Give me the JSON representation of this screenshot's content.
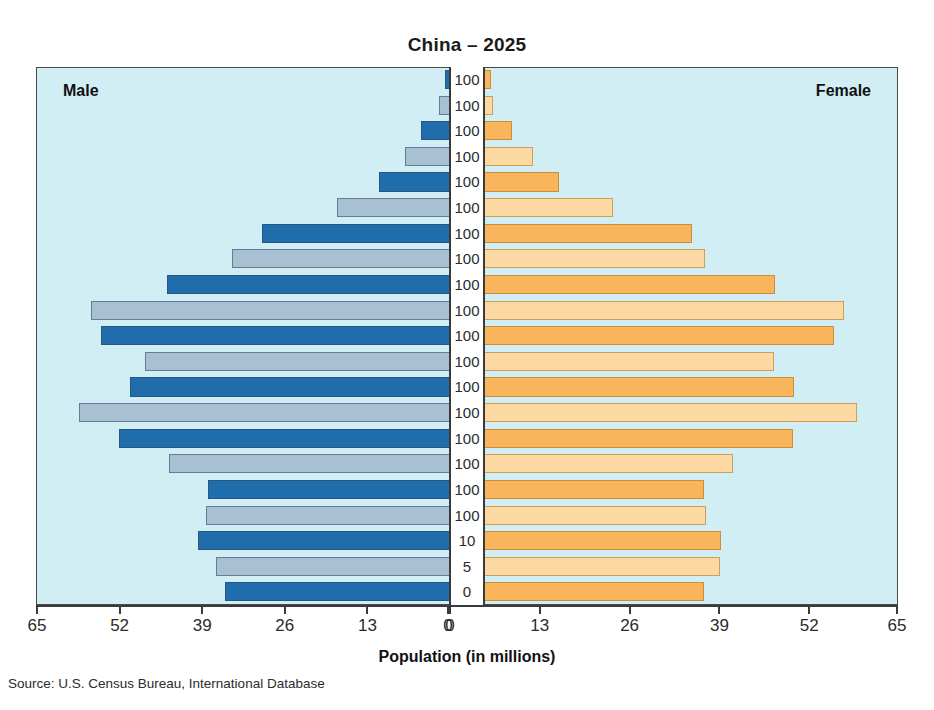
{
  "title": "China – 2025",
  "axis_title": "Population (in millions)",
  "source": "Source: U.S. Census Bureau, International Database",
  "labels": {
    "male": "Male",
    "female": "Female"
  },
  "colors": {
    "panel_background": "#d2eef5",
    "male_dark": "#1f6eab",
    "male_light": "#a9c0d2",
    "female_dark": "#f9b55b",
    "female_light": "#fcd9a2",
    "axis": "#3a3a3a",
    "text": "#1a1a1a",
    "page_background": "#ffffff"
  },
  "chart_data": {
    "type": "bar",
    "subtype": "population-pyramid",
    "title": "China – 2025",
    "xlabel": "Population (in millions)",
    "ylabel": "",
    "xlim": [
      0,
      65
    ],
    "grid": false,
    "legend_position": "in-plot-corners",
    "axis_left_ticks": [
      "65",
      "52",
      "39",
      "26",
      "13",
      "0"
    ],
    "axis_right_ticks": [
      "0",
      "13",
      "26",
      "39",
      "52",
      "65"
    ],
    "tick_values": [
      0,
      13,
      26,
      39,
      52,
      65
    ],
    "center_axis_labels": [
      "100",
      "100",
      "100",
      "100",
      "100",
      "100",
      "100",
      "100",
      "100",
      "100",
      "100",
      "100",
      "100",
      "100",
      "100",
      "100",
      "100",
      "100",
      "10",
      "5",
      "0"
    ],
    "rows": [
      {
        "center_label": "100",
        "male": 0.6,
        "female": 1.0,
        "shade": "dark"
      },
      {
        "center_label": "100",
        "male": 1.6,
        "female": 1.2,
        "shade": "light"
      },
      {
        "center_label": "100",
        "male": 4.4,
        "female": 4.2,
        "shade": "dark"
      },
      {
        "center_label": "100",
        "male": 7.0,
        "female": 7.6,
        "shade": "light"
      },
      {
        "center_label": "100",
        "male": 11.0,
        "female": 11.6,
        "shade": "dark"
      },
      {
        "center_label": "100",
        "male": 17.6,
        "female": 20.2,
        "shade": "light"
      },
      {
        "center_label": "100",
        "male": 29.4,
        "female": 32.5,
        "shade": "dark"
      },
      {
        "center_label": "100",
        "male": 34.2,
        "female": 34.6,
        "shade": "light"
      },
      {
        "center_label": "100",
        "male": 44.4,
        "female": 45.6,
        "shade": "dark"
      },
      {
        "center_label": "100",
        "male": 56.4,
        "female": 56.5,
        "shade": "light"
      },
      {
        "center_label": "100",
        "male": 54.8,
        "female": 55.0,
        "shade": "dark"
      },
      {
        "center_label": "100",
        "male": 47.9,
        "female": 45.5,
        "shade": "light"
      },
      {
        "center_label": "100",
        "male": 50.2,
        "female": 48.6,
        "shade": "dark"
      },
      {
        "center_label": "100",
        "male": 58.3,
        "female": 58.6,
        "shade": "light"
      },
      {
        "center_label": "100",
        "male": 52.0,
        "female": 48.5,
        "shade": "dark"
      },
      {
        "center_label": "100",
        "male": 44.0,
        "female": 39.0,
        "shade": "light"
      },
      {
        "center_label": "100",
        "male": 38.0,
        "female": 34.4,
        "shade": "dark"
      },
      {
        "center_label": "100",
        "male": 38.3,
        "female": 34.8,
        "shade": "light"
      },
      {
        "center_label": "10",
        "male": 39.5,
        "female": 37.2,
        "shade": "dark"
      },
      {
        "center_label": "5",
        "male": 36.6,
        "female": 37.0,
        "shade": "light"
      },
      {
        "center_label": "0",
        "male": 35.2,
        "female": 34.4,
        "shade": "dark"
      }
    ]
  }
}
